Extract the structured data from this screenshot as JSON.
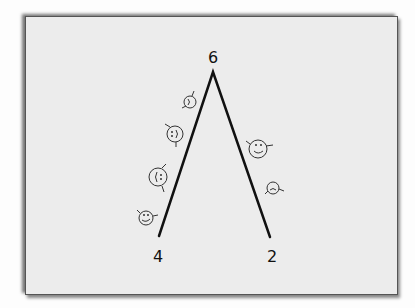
{
  "diagram": {
    "type": "hand-drawn peak diagram",
    "labels": {
      "peak": "6",
      "left_end": "4",
      "right_end": "2"
    },
    "figures": {
      "left_side_count": 4,
      "right_side_count": 2,
      "description": "small smiley-face figures climbing the sides of an inverted V"
    },
    "colors": {
      "ink": "#111111",
      "paper": "#ececec",
      "frame": "#555555"
    }
  }
}
